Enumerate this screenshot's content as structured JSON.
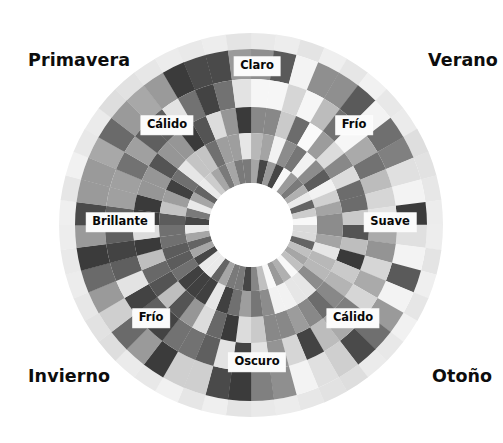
{
  "figure": {
    "type": "seasonal-color-wheel",
    "background_color": "#ffffff",
    "center": {
      "x": 251,
      "y": 225
    },
    "outer_radius": 192,
    "inner_hole_radius": 42,
    "label_text_color": "#0d0d0d",
    "label_box_color": "#fbfbfb"
  },
  "seasons": [
    {
      "id": "primavera",
      "label": "Primavera",
      "quadrant": "upper-left",
      "x": 28,
      "y": 52
    },
    {
      "id": "verano",
      "label": "Verano",
      "quadrant": "upper-right",
      "x": 428,
      "y": 52
    },
    {
      "id": "invierno",
      "label": "Invierno",
      "quadrant": "lower-left",
      "x": 28,
      "y": 368
    },
    {
      "id": "otono",
      "label": "Otoño",
      "quadrant": "lower-right",
      "x": 432,
      "y": 368
    }
  ],
  "ring_labels": [
    {
      "id": "claro",
      "label": "Claro",
      "angle_deg": 270,
      "x": 257,
      "y": 66,
      "position": "top"
    },
    {
      "id": "frio-verano",
      "label": "Frío",
      "angle_deg": 315,
      "x": 354,
      "y": 125,
      "position": "upper-right"
    },
    {
      "id": "suave",
      "label": "Suave",
      "angle_deg": 0,
      "x": 390,
      "y": 222,
      "position": "right"
    },
    {
      "id": "calido-otono",
      "label": "Cálido",
      "angle_deg": 45,
      "x": 353,
      "y": 318,
      "position": "lower-right"
    },
    {
      "id": "oscuro",
      "label": "Oscuro",
      "angle_deg": 90,
      "x": 257,
      "y": 362,
      "position": "bottom"
    },
    {
      "id": "frio-invierno",
      "label": "Frío",
      "angle_deg": 135,
      "x": 151,
      "y": 318,
      "position": "lower-left"
    },
    {
      "id": "brillante",
      "label": "Brillante",
      "angle_deg": 180,
      "x": 120,
      "y": 222,
      "position": "left"
    },
    {
      "id": "calido-primavera",
      "label": "Cálido",
      "angle_deg": 225,
      "x": 167,
      "y": 125,
      "position": "upper-left"
    }
  ],
  "chart_data": {
    "type": "pie",
    "legend_position": "corners",
    "categories": [
      "Primavera",
      "Verano",
      "Otoño",
      "Invierno"
    ],
    "ring_names": [
      "Claro",
      "Frío",
      "Suave",
      "Cálido",
      "Oscuro",
      "Frío",
      "Brillante",
      "Cálido"
    ],
    "rings": [
      {
        "index": 0,
        "name": "halo",
        "r_inner": 176,
        "r_outer": 192,
        "segments": 48
      },
      {
        "index": 1,
        "name": "ring-1",
        "r_inner": 146,
        "r_outer": 176,
        "segments": 48
      },
      {
        "index": 2,
        "name": "ring-2",
        "r_inner": 118,
        "r_outer": 146,
        "segments": 48
      },
      {
        "index": 3,
        "name": "ring-3",
        "r_inner": 92,
        "r_outer": 118,
        "segments": 48
      },
      {
        "index": 4,
        "name": "ring-4",
        "r_inner": 66,
        "r_outer": 92,
        "segments": 48
      },
      {
        "index": 5,
        "name": "ring-5",
        "r_inner": 42,
        "r_outer": 66,
        "segments": 48
      }
    ],
    "grays": {
      "halo": [
        "#e9e9e9",
        "#ededed",
        "#e4e4e4",
        "#efefef",
        "#e6e6e6",
        "#f1f1f1",
        "#e8e8e8",
        "#ebebeb",
        "#dedede",
        "#e2e2e2",
        "#e7e7e7",
        "#ececec"
      ],
      "ring1": [
        "#f3f3f3",
        "#e0e0e0",
        "#8f8f8f",
        "#6f6f6f",
        "#5a5a5a",
        "#808080",
        "#a8a8a8",
        "#cfcfcf",
        "#4a4a4a",
        "#3b3b3b",
        "#6a6a6a",
        "#9a9a9a"
      ],
      "ring2": [
        "#f6f6f6",
        "#d6d6d6",
        "#aaaaaa",
        "#7e7e7e",
        "#949494",
        "#bcbcbc",
        "#e3e3e3",
        "#5f5f5f",
        "#434343",
        "#727272",
        "#a0a0a0",
        "#c8c8c8"
      ],
      "ring3": [
        "#fafafa",
        "#cacaca",
        "#9c9c9c",
        "#6c6c6c",
        "#888888",
        "#b4b4b4",
        "#dcdcdc",
        "#545454",
        "#3a3a3a",
        "#686868",
        "#969696",
        "#bebebe"
      ],
      "ring4": [
        "#f2f2f2",
        "#d0d0d0",
        "#a4a4a4",
        "#767676",
        "#8c8c8c",
        "#b8b8b8",
        "#e6e6e6",
        "#5c5c5c",
        "#404040",
        "#707070",
        "#9e9e9e",
        "#c4c4c4"
      ],
      "ring5": [
        "#f8f8f8",
        "#dadada",
        "#b0b0b0",
        "#868686",
        "#9a9a9a",
        "#c0c0c0",
        "#eaeaea",
        "#646464",
        "#464646",
        "#7a7a7a",
        "#a6a6a6",
        "#cccccc"
      ]
    }
  }
}
